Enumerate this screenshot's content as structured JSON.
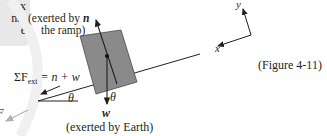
{
  "side_note": {
    "lines": [
      "x",
      "nal",
      "e"
    ]
  },
  "labels": {
    "normal_force_desc_line1": "(exerted by",
    "normal_force_symbol": "n⃗",
    "normal_force_desc_line2": "the ramp)",
    "weight_symbol": "w⃗",
    "weight_desc": "(exerted by Earth)",
    "net_force_equation": "ΣF⃗ext = n⃗ + w⃗",
    "net_force_lhs": "ΣF",
    "net_force_sub": "ext",
    "net_force_rhs": "= n + w",
    "angle_ramp": "θ",
    "angle_vectors": "θ",
    "axis_x": "x",
    "axis_y": "y",
    "figure_ref": "(Figure 4-11)",
    "clipped_vector_label": "F"
  },
  "colors": {
    "block_fill": "#8a8a8a",
    "block_stroke": "#4a4a4a",
    "line": "#231f20",
    "faded_arrow": "#b0b0b0",
    "side_box": "#e8e8e8"
  }
}
